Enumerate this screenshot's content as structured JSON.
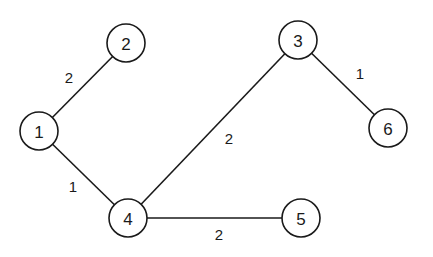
{
  "graph": {
    "nodes": [
      {
        "id": "1",
        "label": "1",
        "x": 39,
        "y": 131
      },
      {
        "id": "2",
        "label": "2",
        "x": 126,
        "y": 43
      },
      {
        "id": "3",
        "label": "3",
        "x": 298,
        "y": 40
      },
      {
        "id": "4",
        "label": "4",
        "x": 128,
        "y": 218
      },
      {
        "id": "5",
        "label": "5",
        "x": 301,
        "y": 218
      },
      {
        "id": "6",
        "label": "6",
        "x": 388,
        "y": 128
      }
    ],
    "edges": [
      {
        "from": "1",
        "to": "2",
        "weight": "2",
        "label_x": 69,
        "label_y": 77
      },
      {
        "from": "1",
        "to": "4",
        "weight": "1",
        "label_x": 73,
        "label_y": 186
      },
      {
        "from": "4",
        "to": "3",
        "weight": "2",
        "label_x": 229,
        "label_y": 138
      },
      {
        "from": "3",
        "to": "6",
        "weight": "1",
        "label_x": 360,
        "label_y": 73
      },
      {
        "from": "4",
        "to": "5",
        "weight": "2",
        "label_x": 219,
        "label_y": 234
      }
    ],
    "node_radius": 19,
    "stroke_color": "#1a1a1a",
    "background_color": "#ffffff"
  }
}
